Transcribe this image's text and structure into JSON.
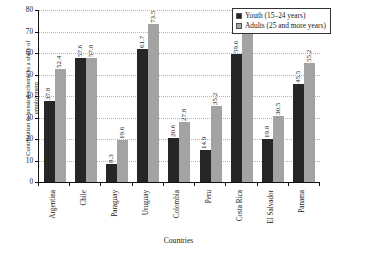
{
  "chart_data": {
    "type": "bar",
    "title": "",
    "xlabel": "Countries",
    "ylabel_line1": "Contribution to pension scheme as a share of",
    "ylabel_line2": "employment",
    "categories": [
      "Argentina",
      "Chile",
      "Paraguay",
      "Uruguay",
      "Colombia",
      "Peru",
      "Costa Rica",
      "El Salvador",
      "Panama"
    ],
    "series": [
      {
        "name": "Youth (15–24 years)",
        "color": "#262626",
        "values": [
          37.8,
          57.6,
          8.3,
          61.7,
          20.6,
          14.9,
          59.6,
          19.8,
          45.5
        ]
      },
      {
        "name": "Adults (25 and more years)",
        "color": "#a3a3a3",
        "values": [
          52.4,
          57.8,
          19.6,
          73.5,
          27.8,
          35.2,
          70.8,
          30.5,
          55.2
        ]
      }
    ],
    "ylim": [
      0,
      80
    ],
    "ytick_values": [
      0,
      10,
      20,
      30,
      40,
      50,
      60,
      70,
      80
    ],
    "ytick_labels": [
      "0",
      "10",
      "20",
      "30",
      "40",
      "50",
      "60",
      "70",
      "80"
    ],
    "grid": true,
    "grid_style": "dotted",
    "legend_position": "top-right",
    "legend_entries": [
      "Youth (15–24 years)",
      "Adults (25 and more years)"
    ]
  }
}
